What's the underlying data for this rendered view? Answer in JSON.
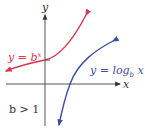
{
  "diagram": {
    "type": "function-graph",
    "axes": {
      "x_label": "x",
      "y_label": "y"
    },
    "curves": [
      {
        "name": "exponential",
        "label": "y = b",
        "superscript": "x",
        "color": "#d8344c"
      },
      {
        "name": "logarithm",
        "label": "y = log",
        "subscript": "b",
        "label_tail": " x",
        "color": "#3b4ea6"
      }
    ],
    "condition": "b > 1"
  }
}
